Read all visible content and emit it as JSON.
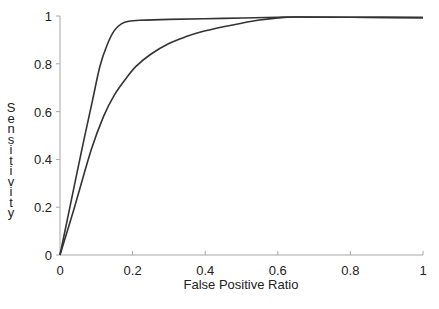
{
  "chart_data": {
    "type": "line",
    "title": "",
    "xlabel": "False Positive Ratio",
    "ylabel": "Sensitivity",
    "xlim": [
      0,
      1
    ],
    "ylim": [
      0,
      1
    ],
    "grid": false,
    "legend": null,
    "x_ticks": [
      "0",
      "0.2",
      "0.4",
      "0.6",
      "0.8",
      "1"
    ],
    "y_ticks": [
      "0",
      "0.2",
      "0.4",
      "0.6",
      "0.8",
      "1"
    ],
    "series": [
      {
        "name": "curve-upper",
        "x": [
          0,
          0.03,
          0.06,
          0.09,
          0.11,
          0.13,
          0.15,
          0.17,
          0.19,
          0.22,
          0.3,
          0.45,
          0.6,
          0.65,
          0.8,
          1.0
        ],
        "y": [
          0,
          0.22,
          0.44,
          0.65,
          0.79,
          0.88,
          0.94,
          0.968,
          0.978,
          0.982,
          0.986,
          0.99,
          0.995,
          0.996,
          0.995,
          0.993
        ]
      },
      {
        "name": "curve-lower",
        "x": [
          0,
          0.04,
          0.086,
          0.12,
          0.15,
          0.18,
          0.21,
          0.25,
          0.3,
          0.35,
          0.39,
          0.45,
          0.5,
          0.55,
          0.6,
          0.65,
          0.8,
          1.0
        ],
        "y": [
          0,
          0.2,
          0.44,
          0.58,
          0.67,
          0.735,
          0.79,
          0.84,
          0.885,
          0.915,
          0.934,
          0.955,
          0.97,
          0.983,
          0.992,
          0.996,
          0.995,
          0.993
        ]
      }
    ]
  },
  "colors": {
    "curve": "#333333",
    "axis": "#999999",
    "text": "#222222"
  }
}
